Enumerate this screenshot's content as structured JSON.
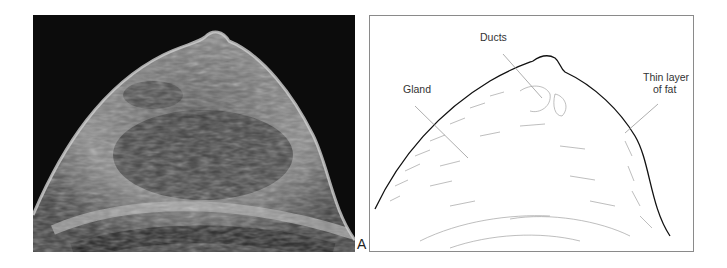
{
  "figure": {
    "panel_letter": "A",
    "left_panel": {
      "type": "ultrasound-image",
      "description": "Grayscale ultrasound scan of breast"
    },
    "right_panel": {
      "type": "line-drawing",
      "labels": {
        "gland": "Gland",
        "ducts": "Ducts",
        "fat_line1": "Thin layer",
        "fat_line2": "of fat"
      }
    }
  },
  "colors": {
    "ultrasound_bg": "#0c0c0c",
    "line": "#222222",
    "border": "#8a8a8a"
  }
}
